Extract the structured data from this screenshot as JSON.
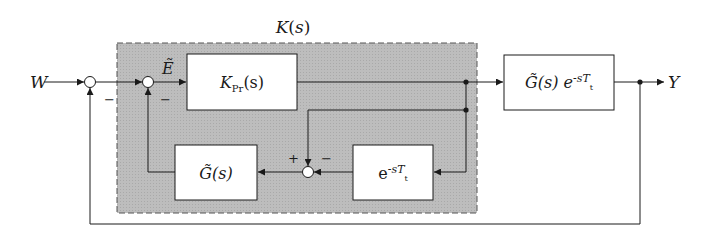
{
  "diagram": {
    "type": "block-diagram",
    "controller_group": {
      "label": "K(s)",
      "fill": "#b8b8b8",
      "border": "dashed"
    },
    "signals": {
      "input": "W",
      "output": "Y",
      "error": "Ẽ"
    },
    "blocks": {
      "controller": {
        "main": "K",
        "sub": "Pr",
        "arg": "(s)"
      },
      "plant": {
        "main": "G̃(s) e",
        "sup": "-sT",
        "sub": "t"
      },
      "model": {
        "main": "G̃(s)"
      },
      "delay_model": {
        "main": "e",
        "sup": "-sT",
        "sub": "t"
      }
    },
    "summing_junctions": {
      "sum1": {
        "signs": [
          "+",
          "−"
        ]
      },
      "sum2": {
        "signs": [
          "+",
          "−"
        ]
      },
      "sum3": {
        "plus": "+",
        "minus": "−"
      }
    },
    "sign_labels": {
      "sum1_minus": "−",
      "sum2_minus": "−",
      "sum3_plus": "+",
      "sum3_minus": "−"
    }
  }
}
